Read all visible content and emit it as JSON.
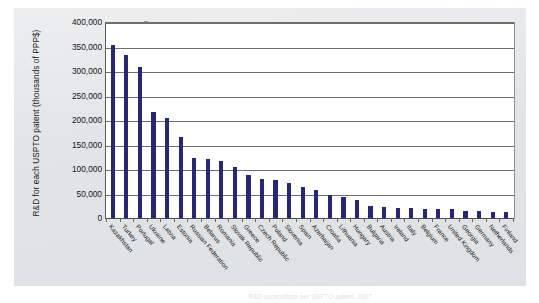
{
  "figure": {
    "caption_cutoff": "R&D expenditure per USPTO patent, 2007"
  },
  "chart_data": {
    "type": "bar",
    "title": "",
    "xlabel": "",
    "ylabel": "R&D for each USPTO patent (thousands of PPP$)",
    "ylim": [
      0,
      400000
    ],
    "ytick_labels": [
      "400,000",
      "350,000",
      "300,000",
      "250,000",
      "200,000",
      "150,000",
      "100,000",
      "50,000",
      "0"
    ],
    "ytick_values": [
      400000,
      350000,
      300000,
      250000,
      200000,
      150000,
      100000,
      50000,
      0
    ],
    "grid": true,
    "legend": "none",
    "bar_color": "#26267e",
    "categories": [
      "Kazakhstan",
      "Turkey",
      "Portugal",
      "Ukraine",
      "Latvia",
      "Estonia",
      "Russian Federation",
      "Belarus",
      "Romania",
      "Slovak Republic",
      "Greece",
      "Czech Republic",
      "Poland",
      "Slovenia",
      "Spain",
      "Azerbaijan",
      "Croatia",
      "Lithuania",
      "Hungary",
      "Bulgaria",
      "Austria",
      "Ireland",
      "Italy",
      "Belgium",
      "France",
      "United Kingdom",
      "Georgia",
      "Germany",
      "Netherlands",
      "Finland"
    ],
    "values": [
      353000,
      332000,
      309000,
      217000,
      204000,
      165000,
      123000,
      121000,
      116000,
      104000,
      88000,
      79000,
      77000,
      72000,
      63000,
      58000,
      47000,
      42000,
      36000,
      25000,
      22000,
      21000,
      20000,
      19000,
      18000,
      18000,
      15000,
      14000,
      13000,
      12000
    ]
  }
}
